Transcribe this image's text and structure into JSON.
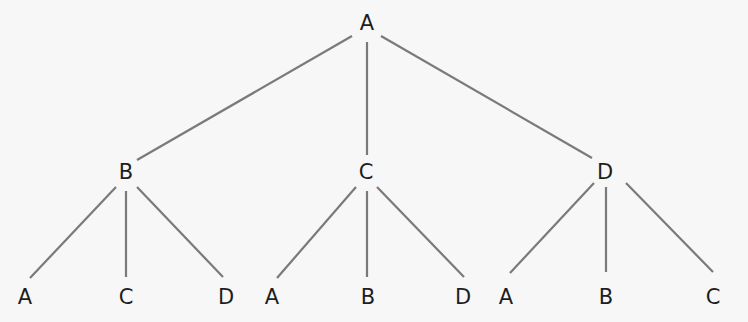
{
  "diagram": {
    "type": "tree",
    "colors": {
      "background": "#f7f7f7",
      "edge": "#7a7a7a",
      "label": "#1e1e1e"
    },
    "root": {
      "id": "root",
      "label": "A",
      "x": 367,
      "y": 23
    },
    "level1": [
      {
        "id": "n-b",
        "label": "B",
        "x": 126,
        "y": 172,
        "parent": "root"
      },
      {
        "id": "n-c",
        "label": "C",
        "x": 366,
        "y": 172,
        "parent": "root"
      },
      {
        "id": "n-d",
        "label": "D",
        "x": 605,
        "y": 172,
        "parent": "root"
      }
    ],
    "level2": [
      {
        "id": "n-b-a",
        "label": "A",
        "x": 25,
        "y": 297,
        "parent": "n-b"
      },
      {
        "id": "n-b-c",
        "label": "C",
        "x": 126,
        "y": 297,
        "parent": "n-b"
      },
      {
        "id": "n-b-d",
        "label": "D",
        "x": 226,
        "y": 297,
        "parent": "n-b"
      },
      {
        "id": "n-c-a",
        "label": "A",
        "x": 272,
        "y": 297,
        "parent": "n-c"
      },
      {
        "id": "n-c-b",
        "label": "B",
        "x": 368,
        "y": 297,
        "parent": "n-c"
      },
      {
        "id": "n-c-d",
        "label": "D",
        "x": 463,
        "y": 297,
        "parent": "n-c"
      },
      {
        "id": "n-d-a",
        "label": "A",
        "x": 506,
        "y": 297,
        "parent": "n-d"
      },
      {
        "id": "n-d-b",
        "label": "B",
        "x": 606,
        "y": 297,
        "parent": "n-d"
      },
      {
        "id": "n-d-c",
        "label": "C",
        "x": 713,
        "y": 297,
        "parent": "n-d"
      }
    ],
    "edges": [
      {
        "from": "root",
        "to": "n-b",
        "x1": 352,
        "y1": 36,
        "x2": 137,
        "y2": 160
      },
      {
        "from": "root",
        "to": "n-c",
        "x1": 367,
        "y1": 42,
        "x2": 367,
        "y2": 155
      },
      {
        "from": "root",
        "to": "n-d",
        "x1": 381,
        "y1": 36,
        "x2": 592,
        "y2": 158
      },
      {
        "from": "n-b",
        "to": "n-b-a",
        "x1": 116,
        "y1": 187,
        "x2": 30,
        "y2": 278
      },
      {
        "from": "n-b",
        "to": "n-b-c",
        "x1": 126,
        "y1": 191,
        "x2": 126,
        "y2": 277
      },
      {
        "from": "n-b",
        "to": "n-b-d",
        "x1": 137,
        "y1": 187,
        "x2": 223,
        "y2": 277
      },
      {
        "from": "n-c",
        "to": "n-c-a",
        "x1": 356,
        "y1": 187,
        "x2": 277,
        "y2": 278
      },
      {
        "from": "n-c",
        "to": "n-c-b",
        "x1": 367,
        "y1": 191,
        "x2": 367,
        "y2": 277
      },
      {
        "from": "n-c",
        "to": "n-c-d",
        "x1": 377,
        "y1": 187,
        "x2": 464,
        "y2": 277
      },
      {
        "from": "n-d",
        "to": "n-d-a",
        "x1": 594,
        "y1": 183,
        "x2": 510,
        "y2": 273
      },
      {
        "from": "n-d",
        "to": "n-d-b",
        "x1": 606,
        "y1": 187,
        "x2": 606,
        "y2": 272
      },
      {
        "from": "n-d",
        "to": "n-d-c",
        "x1": 626,
        "y1": 183,
        "x2": 713,
        "y2": 272
      }
    ]
  }
}
